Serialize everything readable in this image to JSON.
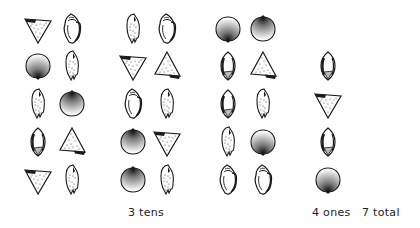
{
  "labels": {
    "tens": "3 tens",
    "ones": "4 ones",
    "total": "7 total"
  },
  "groups": [
    {
      "name": "ten-group-1",
      "shells": [
        {
          "type": "cone-down",
          "x": 23,
          "y": 12
        },
        {
          "type": "conch",
          "x": 57,
          "y": 12
        },
        {
          "type": "clam-down",
          "x": 23,
          "y": 49
        },
        {
          "type": "olive",
          "x": 57,
          "y": 49
        },
        {
          "type": "olive",
          "x": 23,
          "y": 87
        },
        {
          "type": "clam-up",
          "x": 57,
          "y": 87
        },
        {
          "type": "cowrie",
          "x": 23,
          "y": 125
        },
        {
          "type": "cone-up",
          "x": 57,
          "y": 125
        },
        {
          "type": "cone-down",
          "x": 23,
          "y": 163
        },
        {
          "type": "olive",
          "x": 57,
          "y": 163
        }
      ]
    },
    {
      "name": "ten-group-2",
      "shells": [
        {
          "type": "olive",
          "x": 118,
          "y": 12
        },
        {
          "type": "conch",
          "x": 152,
          "y": 12
        },
        {
          "type": "cone-down",
          "x": 118,
          "y": 49
        },
        {
          "type": "cone-up",
          "x": 152,
          "y": 49
        },
        {
          "type": "conch",
          "x": 118,
          "y": 87
        },
        {
          "type": "olive",
          "x": 152,
          "y": 87
        },
        {
          "type": "clam-up",
          "x": 118,
          "y": 125
        },
        {
          "type": "cone-down",
          "x": 152,
          "y": 125
        },
        {
          "type": "clam-up",
          "x": 118,
          "y": 163
        },
        {
          "type": "olive",
          "x": 152,
          "y": 163
        }
      ]
    },
    {
      "name": "ten-group-3",
      "shells": [
        {
          "type": "clam-down",
          "x": 213,
          "y": 12
        },
        {
          "type": "clam-up",
          "x": 248,
          "y": 12
        },
        {
          "type": "cowrie",
          "x": 213,
          "y": 49
        },
        {
          "type": "cone-up",
          "x": 248,
          "y": 49
        },
        {
          "type": "cowrie",
          "x": 213,
          "y": 87
        },
        {
          "type": "olive",
          "x": 248,
          "y": 87
        },
        {
          "type": "olive",
          "x": 213,
          "y": 125
        },
        {
          "type": "clam-down",
          "x": 248,
          "y": 125
        },
        {
          "type": "conch",
          "x": 213,
          "y": 163
        },
        {
          "type": "conch",
          "x": 248,
          "y": 163
        }
      ]
    },
    {
      "name": "ones-group",
      "shells": [
        {
          "type": "cowrie",
          "x": 313,
          "y": 49
        },
        {
          "type": "cone-down",
          "x": 313,
          "y": 87
        },
        {
          "type": "cowrie",
          "x": 313,
          "y": 125
        },
        {
          "type": "clam-down",
          "x": 313,
          "y": 163
        }
      ]
    }
  ],
  "label_positions": {
    "tens": 128,
    "ones": 312,
    "total": 362
  },
  "colors": {
    "ink": "#1a1a1a",
    "background": "#ffffff"
  }
}
